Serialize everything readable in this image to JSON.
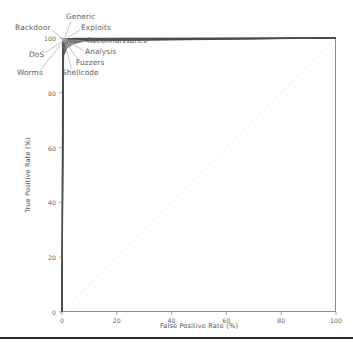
{
  "chart_data": {
    "type": "line",
    "title": "",
    "subtitle": "",
    "xlabel": "False Positive Rate (%)",
    "ylabel": "True Positive Rate (%)",
    "xlim": [
      0,
      100
    ],
    "ylim": [
      0,
      100
    ],
    "xticks": [
      "0",
      "20",
      "40",
      "60",
      "80",
      "100"
    ],
    "xtick_values": [
      0,
      20,
      40,
      60,
      80,
      100
    ],
    "yticks": [
      "0",
      "20",
      "40",
      "60",
      "80",
      "100"
    ],
    "ytick_values": [
      0,
      20,
      40,
      60,
      80,
      100
    ],
    "grid": false,
    "legend_position": "annotations-outside-top-left",
    "reference_line": {
      "name": "chance-diagonal",
      "style": "dotted",
      "color": "#d8d8d8",
      "x": [
        0,
        100
      ],
      "y": [
        0,
        100
      ]
    },
    "curve_color": "#4a4a4a",
    "series": [
      {
        "name": "Generic",
        "x": [
          0,
          0.2,
          0.6,
          1.6,
          4.0,
          100
        ],
        "y": [
          0,
          97.5,
          99.0,
          99.6,
          99.9,
          100
        ]
      },
      {
        "name": "Backdoor",
        "x": [
          0,
          0.3,
          0.9,
          2.2,
          5.0,
          100
        ],
        "y": [
          0,
          96.5,
          98.4,
          99.2,
          99.7,
          100
        ]
      },
      {
        "name": "Exploits",
        "x": [
          0,
          0.25,
          0.8,
          2.0,
          4.5,
          100
        ],
        "y": [
          0,
          97.0,
          98.8,
          99.4,
          99.8,
          100
        ]
      },
      {
        "name": "Reconnaissance",
        "x": [
          0,
          0.35,
          1.0,
          2.5,
          5.5,
          100
        ],
        "y": [
          0,
          96.0,
          98.2,
          99.0,
          99.6,
          100
        ]
      },
      {
        "name": "DoS",
        "x": [
          0,
          0.4,
          1.2,
          2.8,
          6.0,
          100
        ],
        "y": [
          0,
          95.5,
          97.9,
          98.8,
          99.5,
          100
        ]
      },
      {
        "name": "Analysis",
        "x": [
          0,
          0.45,
          1.3,
          3.0,
          6.5,
          100
        ],
        "y": [
          0,
          95.0,
          97.6,
          98.6,
          99.4,
          100
        ]
      },
      {
        "name": "Fuzzers",
        "x": [
          0,
          0.5,
          1.5,
          3.4,
          7.0,
          100
        ],
        "y": [
          0,
          94.5,
          97.2,
          98.4,
          99.2,
          100
        ]
      },
      {
        "name": "Worms",
        "x": [
          0,
          0.55,
          1.7,
          3.8,
          7.5,
          100
        ],
        "y": [
          0,
          94.0,
          96.9,
          98.1,
          99.1,
          100
        ]
      },
      {
        "name": "Shellcode",
        "x": [
          0,
          0.6,
          1.9,
          4.2,
          8.0,
          100
        ],
        "y": [
          0,
          93.5,
          96.5,
          97.9,
          98.9,
          100
        ]
      }
    ],
    "annotations": [
      {
        "label": "Generic",
        "x": 66,
        "y": 12
      },
      {
        "label": "Backdoor",
        "x": 15,
        "y": 23
      },
      {
        "label": "Exploits",
        "x": 81,
        "y": 23
      },
      {
        "label": "Reconnaissance",
        "x": 87,
        "y": 36
      },
      {
        "label": "DoS",
        "x": 29,
        "y": 50
      },
      {
        "label": "Analysis",
        "x": 85,
        "y": 47
      },
      {
        "label": "Fuzzers",
        "x": 76,
        "y": 58
      },
      {
        "label": "Worms",
        "x": 17,
        "y": 68
      },
      {
        "label": "Shellcode",
        "x": 62,
        "y": 68
      }
    ]
  }
}
